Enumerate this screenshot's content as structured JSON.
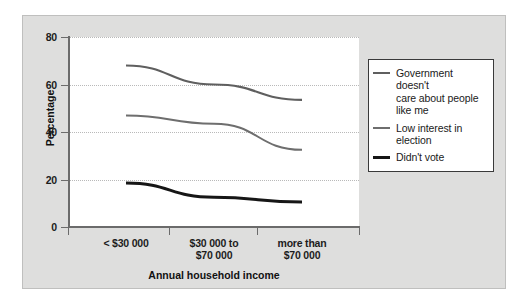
{
  "chart_data": {
    "type": "line",
    "title": "",
    "xlabel": "Annual household income",
    "ylabel": "Percentage",
    "categories": [
      "< $30 000",
      "$30 000 to\n$70 000",
      "more than\n$70 000"
    ],
    "category_lines": [
      [
        "< $30 000"
      ],
      [
        "$30 000 to",
        "$70 000"
      ],
      [
        "more than",
        "$70 000"
      ]
    ],
    "ylim": [
      0,
      80
    ],
    "yticks": [
      0,
      20,
      40,
      60,
      80
    ],
    "ytick_labels": [
      "0",
      "20",
      "40",
      "60",
      "80"
    ],
    "grid": true,
    "grid_axis": "y",
    "legend_position": "right",
    "series": [
      {
        "name": "Government doesn't care about people like me",
        "legend_lines": [
          "Government doesn't",
          "care about people",
          "like me"
        ],
        "values": [
          68,
          60,
          53.5
        ],
        "color": "#5f5f5f",
        "width": 2.2
      },
      {
        "name": "Low interest in election",
        "legend_lines": [
          "Low interest in",
          "election"
        ],
        "values": [
          47,
          43.5,
          32.5
        ],
        "color": "#6e6e6e",
        "width": 2.0
      },
      {
        "name": "Didn't vote",
        "legend_lines": [
          "Didn't vote"
        ],
        "values": [
          18.5,
          12.5,
          10.5
        ],
        "color": "#161616",
        "width": 3.0
      }
    ]
  },
  "figure": {
    "background_color": "#dededd",
    "plot_background_color": "#ffffff",
    "border_color": "#bfbfbe",
    "axis_color": "#6b6b6b",
    "grid_color": "#b9b9b9",
    "legend_border_color": "#3a3a3a"
  }
}
